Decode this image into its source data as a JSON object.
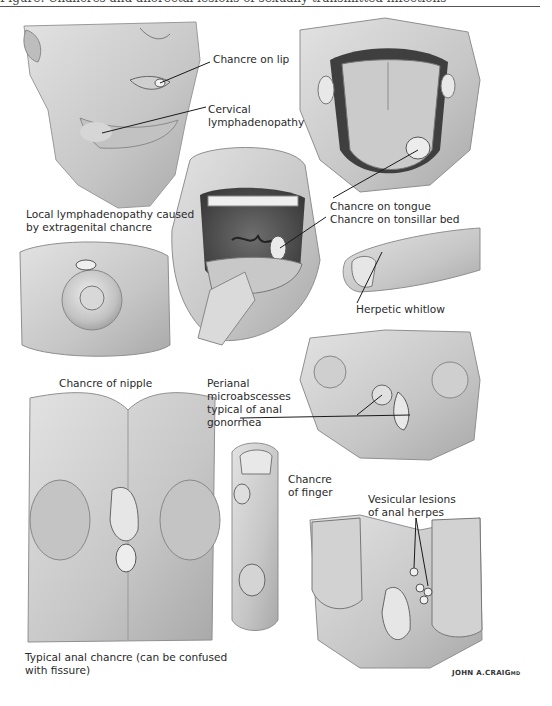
{
  "header": {
    "running_title_fragment": "Figure: Chancres and anorectal lesions of sexually transmitted infections"
  },
  "labels": {
    "chancre_on_lip": "Chancre on lip",
    "cervical_lymphadenopathy": "Cervical\nlymphadenopathy",
    "local_lymphadenopathy": "Local lymphadenopathy caused\nby extragenital chancre",
    "chancre_on_tongue": "Chancre on tongue",
    "chancre_on_tonsillar_bed": "Chancre on tonsillar bed",
    "herpetic_whitlow": "Herpetic whitlow",
    "chancre_of_nipple": "Chancre of nipple",
    "perianal_microabscesses": "Perianal\nmicroabscesses\ntypical of anal\ngonorrhea",
    "chancre_of_finger": "Chancre\nof finger",
    "vesicular_lesions": "Vesicular lesions\nof anal herpes",
    "typical_anal_chancre": "Typical anal chancre (can be confused\nwith fissure)"
  },
  "illustrations": [
    {
      "id": "face",
      "subject": "face with lip chancre and cervical lymphadenopathy"
    },
    {
      "id": "tongue",
      "subject": "protruded tongue with chancre"
    },
    {
      "id": "open-mouth",
      "subject": "open mouth with tongue depressor, tonsillar chancre"
    },
    {
      "id": "thumb",
      "subject": "thumb with herpetic whitlow"
    },
    {
      "id": "nipple",
      "subject": "nipple with chancre"
    },
    {
      "id": "perianal-gonorrhea",
      "subject": "perianal region with microabscesses"
    },
    {
      "id": "finger",
      "subject": "finger with chancre"
    },
    {
      "id": "anal-chancre",
      "subject": "perianal region with anal chancre"
    },
    {
      "id": "anal-herpes",
      "subject": "perianal region with vesicular herpes lesions"
    }
  ],
  "signature": {
    "artist": "JOHN A.CRAIG",
    "suffix": "MD"
  },
  "colors": {
    "ink": "#1a1a1a",
    "skin_light": "#d9d9d9",
    "skin_mid": "#b8b8b8",
    "skin_dark": "#8a8a8a"
  }
}
